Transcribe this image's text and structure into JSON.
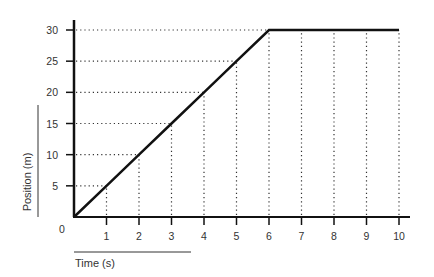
{
  "chart_data": {
    "type": "line",
    "title": "",
    "xlabel": "Time (s)",
    "ylabel": "Position (m)",
    "xlim": [
      0,
      10
    ],
    "ylim": [
      0,
      30
    ],
    "x_ticks": [
      1,
      2,
      3,
      4,
      5,
      6,
      7,
      8,
      9,
      10
    ],
    "y_ticks": [
      5,
      10,
      15,
      20,
      25,
      30
    ],
    "origin_label": "0",
    "grid": "dotted drop lines from each tick to the data line",
    "legend": null,
    "series": [
      {
        "name": "Position",
        "x": [
          0,
          1,
          2,
          3,
          4,
          5,
          6,
          7,
          8,
          9,
          10
        ],
        "y": [
          0,
          5,
          10,
          15,
          20,
          25,
          30,
          30,
          30,
          30,
          30
        ],
        "color": "#111111"
      }
    ]
  },
  "labels": {
    "origin": "0",
    "x_axis_title": "Time (s)",
    "y_axis_title": "Position (m)",
    "x_ticks": [
      "1",
      "2",
      "3",
      "4",
      "5",
      "6",
      "7",
      "8",
      "9",
      "10"
    ],
    "y_ticks": [
      "5",
      "10",
      "15",
      "20",
      "25",
      "30"
    ]
  },
  "colors": {
    "line": "#111111",
    "axis": "#111111",
    "grid": "#333333",
    "text": "#333333"
  }
}
